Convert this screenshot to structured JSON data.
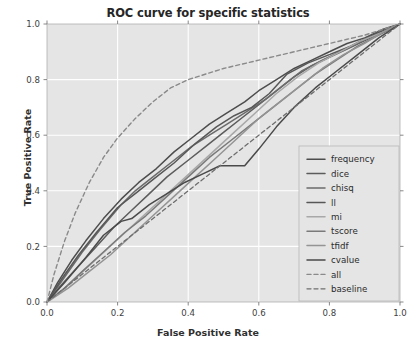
{
  "chart_data": {
    "type": "line",
    "title": "ROC curve for specific statistics",
    "xlabel": "False Positive Rate",
    "ylabel": "True Positive Rate",
    "xlim": [
      0.0,
      1.0
    ],
    "ylim": [
      0.0,
      1.0
    ],
    "xticks": [
      "0.0",
      "0.2",
      "0.4",
      "0.6",
      "0.8",
      "1.0"
    ],
    "yticks": [
      "0.0",
      "0.2",
      "0.4",
      "0.6",
      "0.8",
      "1.0"
    ],
    "xtick_values": [
      0.0,
      0.2,
      0.4,
      0.6,
      0.8,
      1.0
    ],
    "ytick_values": [
      0.0,
      0.2,
      0.4,
      0.6,
      0.8,
      1.0
    ],
    "grid": true,
    "grid_color": "#ffffff",
    "plot_bgcolor": "#e5e5e5",
    "legend_position": "lower right",
    "series": [
      {
        "name": "frequency",
        "color": "#4d4d4d",
        "dash": "solid",
        "width": 1.5,
        "x": [
          0.0,
          0.03,
          0.07,
          0.11,
          0.16,
          0.21,
          0.26,
          0.31,
          0.36,
          0.41,
          0.46,
          0.51,
          0.56,
          0.6,
          0.65,
          0.7,
          0.75,
          0.8,
          0.85,
          0.9,
          0.95,
          1.0
        ],
        "y": [
          0.0,
          0.07,
          0.15,
          0.22,
          0.3,
          0.37,
          0.43,
          0.48,
          0.54,
          0.59,
          0.64,
          0.68,
          0.72,
          0.76,
          0.8,
          0.84,
          0.87,
          0.9,
          0.93,
          0.95,
          0.98,
          1.0
        ]
      },
      {
        "name": "dice",
        "color": "#5c5c5c",
        "dash": "solid",
        "width": 1.5,
        "x": [
          0.0,
          0.04,
          0.09,
          0.14,
          0.19,
          0.24,
          0.29,
          0.34,
          0.4,
          0.45,
          0.5,
          0.55,
          0.6,
          0.65,
          0.7,
          0.75,
          0.8,
          0.85,
          0.9,
          0.95,
          1.0
        ],
        "y": [
          0.0,
          0.06,
          0.13,
          0.2,
          0.27,
          0.33,
          0.39,
          0.45,
          0.51,
          0.56,
          0.61,
          0.66,
          0.71,
          0.76,
          0.81,
          0.85,
          0.88,
          0.91,
          0.94,
          0.97,
          1.0
        ]
      },
      {
        "name": "chisq",
        "color": "#6b6b6b",
        "dash": "solid",
        "width": 1.5,
        "x": [
          0.0,
          0.05,
          0.1,
          0.15,
          0.21,
          0.25,
          0.3,
          0.35,
          0.41,
          0.46,
          0.51,
          0.56,
          0.62,
          0.67,
          0.72,
          0.78,
          0.83,
          0.88,
          0.94,
          1.0
        ],
        "y": [
          0.0,
          0.09,
          0.18,
          0.26,
          0.35,
          0.4,
          0.45,
          0.5,
          0.56,
          0.6,
          0.64,
          0.68,
          0.73,
          0.78,
          0.83,
          0.87,
          0.9,
          0.93,
          0.97,
          1.0
        ]
      },
      {
        "name": "ll",
        "color": "#575757",
        "dash": "solid",
        "width": 1.5,
        "x": [
          0.0,
          0.04,
          0.09,
          0.14,
          0.2,
          0.25,
          0.3,
          0.36,
          0.42,
          0.48,
          0.53,
          0.58,
          0.63,
          0.68,
          0.74,
          0.8,
          0.86,
          0.92,
          1.0
        ],
        "y": [
          0.0,
          0.08,
          0.17,
          0.25,
          0.34,
          0.39,
          0.44,
          0.5,
          0.57,
          0.63,
          0.67,
          0.7,
          0.75,
          0.82,
          0.86,
          0.89,
          0.92,
          0.96,
          1.0
        ]
      },
      {
        "name": "mi",
        "color": "#a8a8a8",
        "dash": "solid",
        "width": 1.5,
        "x": [
          0.0,
          0.05,
          0.11,
          0.17,
          0.23,
          0.29,
          0.35,
          0.41,
          0.47,
          0.53,
          0.59,
          0.65,
          0.71,
          0.77,
          0.83,
          0.89,
          0.95,
          1.0
        ],
        "y": [
          0.0,
          0.05,
          0.12,
          0.19,
          0.26,
          0.33,
          0.4,
          0.47,
          0.54,
          0.61,
          0.68,
          0.75,
          0.81,
          0.86,
          0.9,
          0.94,
          0.97,
          1.0
        ]
      },
      {
        "name": "tscore",
        "color": "#7a7a7a",
        "dash": "solid",
        "width": 1.5,
        "x": [
          0.0,
          0.05,
          0.1,
          0.16,
          0.22,
          0.28,
          0.34,
          0.4,
          0.46,
          0.52,
          0.58,
          0.64,
          0.7,
          0.76,
          0.82,
          0.88,
          0.94,
          1.0
        ],
        "y": [
          0.0,
          0.05,
          0.11,
          0.18,
          0.25,
          0.31,
          0.38,
          0.45,
          0.52,
          0.58,
          0.64,
          0.7,
          0.76,
          0.82,
          0.87,
          0.92,
          0.96,
          1.0
        ]
      },
      {
        "name": "tfidf",
        "color": "#949494",
        "dash": "solid",
        "width": 1.5,
        "x": [
          0.0,
          0.06,
          0.12,
          0.18,
          0.24,
          0.3,
          0.36,
          0.42,
          0.48,
          0.54,
          0.6,
          0.66,
          0.72,
          0.78,
          0.84,
          0.9,
          0.95,
          1.0
        ],
        "y": [
          0.0,
          0.05,
          0.11,
          0.17,
          0.24,
          0.31,
          0.38,
          0.45,
          0.52,
          0.59,
          0.66,
          0.72,
          0.78,
          0.84,
          0.89,
          0.93,
          0.97,
          1.0
        ]
      },
      {
        "name": "cvalue",
        "color": "#4a4a4a",
        "dash": "solid",
        "width": 1.5,
        "x": [
          0.0,
          0.05,
          0.11,
          0.16,
          0.21,
          0.24,
          0.29,
          0.34,
          0.39,
          0.44,
          0.49,
          0.53,
          0.56,
          0.6,
          0.65,
          0.7,
          0.76,
          0.82,
          0.88,
          0.94,
          1.0
        ],
        "y": [
          0.0,
          0.07,
          0.16,
          0.24,
          0.29,
          0.3,
          0.35,
          0.39,
          0.43,
          0.46,
          0.49,
          0.49,
          0.49,
          0.55,
          0.63,
          0.7,
          0.77,
          0.83,
          0.89,
          0.95,
          1.0
        ]
      },
      {
        "name": "all",
        "color": "#8a8a8a",
        "dash": "dashed",
        "width": 1.4,
        "x": [
          0.0,
          0.02,
          0.05,
          0.08,
          0.12,
          0.16,
          0.2,
          0.25,
          0.3,
          0.35,
          0.4,
          0.45,
          0.5,
          0.55,
          0.6,
          0.65,
          0.7,
          0.75,
          0.8,
          0.85,
          0.9,
          0.95,
          1.0
        ],
        "y": [
          0.0,
          0.1,
          0.22,
          0.32,
          0.43,
          0.52,
          0.59,
          0.66,
          0.72,
          0.77,
          0.8,
          0.82,
          0.84,
          0.855,
          0.87,
          0.885,
          0.9,
          0.915,
          0.93,
          0.945,
          0.96,
          0.98,
          1.0
        ]
      },
      {
        "name": "baseline",
        "color": "#6e6e6e",
        "dash": "dashed",
        "width": 1.3,
        "x": [
          0.0,
          1.0
        ],
        "y": [
          0.0,
          1.0
        ]
      }
    ]
  },
  "legend": {
    "items": [
      {
        "label": "frequency"
      },
      {
        "label": "dice"
      },
      {
        "label": "chisq"
      },
      {
        "label": "ll"
      },
      {
        "label": "mi"
      },
      {
        "label": "tscore"
      },
      {
        "label": "tfidf"
      },
      {
        "label": "cvalue"
      },
      {
        "label": "all"
      },
      {
        "label": "baseline"
      }
    ]
  }
}
